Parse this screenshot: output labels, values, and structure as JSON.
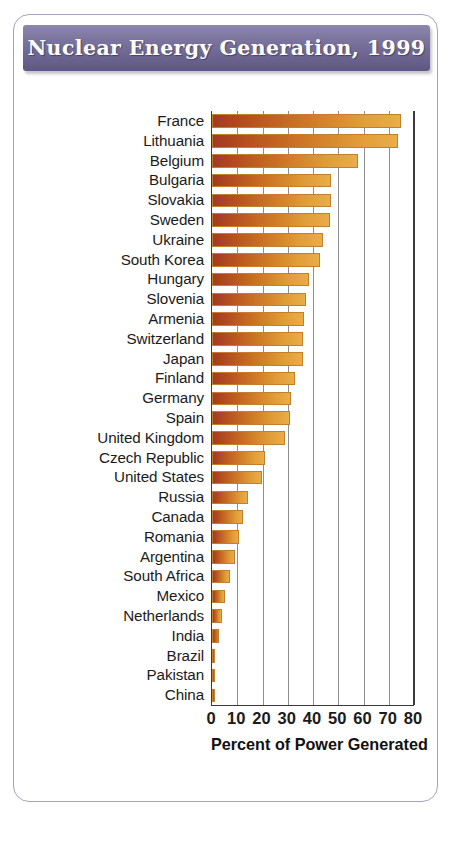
{
  "card": {
    "title": "Nuclear Energy Generation, 1999",
    "border_color": "#a9a0c0",
    "banner_color": "#7d76a0"
  },
  "chart_data": {
    "type": "bar",
    "orientation": "horizontal",
    "title": "Nuclear Energy Generation, 1999",
    "xlabel": "Percent of Power Generated",
    "ylabel": "",
    "xlim": [
      0,
      80
    ],
    "xticks": [
      0,
      10,
      20,
      30,
      40,
      50,
      60,
      70,
      80
    ],
    "grid": true,
    "legend": "none",
    "bar_color_start": "#a33a21",
    "bar_color_end": "#eaad49",
    "categories": [
      "France",
      "Lithuania",
      "Belgium",
      "Bulgaria",
      "Slovakia",
      "Sweden",
      "Ukraine",
      "South Korea",
      "Hungary",
      "Slovenia",
      "Armenia",
      "Switzerland",
      "Japan",
      "Finland",
      "Germany",
      "Spain",
      "United Kingdom",
      "Czech Republic",
      "United States",
      "Russia",
      "Canada",
      "Romania",
      "Argentina",
      "South Africa",
      "Mexico",
      "Netherlands",
      "India",
      "Brazil",
      "Pakistan",
      "China"
    ],
    "values": [
      75,
      73.7,
      57.7,
      47.1,
      47,
      46.8,
      43.8,
      42.8,
      38.3,
      37.2,
      36.4,
      36,
      36,
      33,
      31.2,
      31,
      28.9,
      20.8,
      19.8,
      14.4,
      12.4,
      10.7,
      9,
      7.1,
      5.2,
      4.1,
      2.6,
      1.1,
      0.8,
      1.2
    ]
  }
}
